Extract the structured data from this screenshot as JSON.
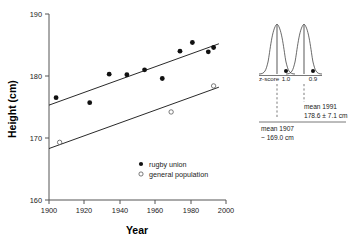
{
  "chart_data": {
    "type": "scatter",
    "title": "",
    "xlabel": "Year",
    "ylabel": "Height (cm)",
    "xlim": [
      1900,
      2000
    ],
    "ylim": [
      160,
      190
    ],
    "xticks": [
      1900,
      1920,
      1940,
      1960,
      1980,
      2000
    ],
    "yticks": [
      160,
      170,
      180,
      190
    ],
    "grid": false,
    "legend_position": "inside-bottom-center",
    "series": [
      {
        "name": "rugby union",
        "marker": "filled-circle",
        "x": [
          1904,
          1923,
          1934,
          1944,
          1954,
          1964,
          1974,
          1981,
          1990,
          1993
        ],
        "y": [
          176.5,
          175.7,
          180.3,
          180.2,
          181.0,
          179.6,
          184.0,
          185.4,
          183.9,
          184.6
        ],
        "trendline": {
          "x": [
            1900,
            1996
          ],
          "y": [
            175.3,
            185.2
          ]
        }
      },
      {
        "name": "general population",
        "marker": "open-circle",
        "x": [
          1906,
          1969,
          1993
        ],
        "y": [
          169.3,
          174.2,
          178.4
        ],
        "trendline": {
          "x": [
            1900,
            1996
          ],
          "y": [
            168.3,
            178.2
          ]
        }
      }
    ]
  },
  "axes": {
    "x_title": "Year",
    "y_title": "Height (cm)",
    "x_tick_labels": [
      "1900",
      "1920",
      "1940",
      "1960",
      "1980",
      "2000"
    ],
    "y_tick_labels": [
      "160",
      "170",
      "180",
      "190"
    ]
  },
  "legend": {
    "entries": [
      {
        "label": "rugby union",
        "marker": "filled-circle"
      },
      {
        "label": "general population",
        "marker": "open-circle"
      }
    ]
  },
  "inset": {
    "zscore_axis_label": "z-score",
    "zscore_left": "1.0",
    "zscore_right": "0.9",
    "annotation_1991_line1": "mean 1991",
    "annotation_1991_line2": "178.6 ± 7.1 cm",
    "annotation_1907_line1": "mean 1907",
    "annotation_1907_line2": "~ 169.0 cm"
  },
  "colors": {
    "ink": "#111111",
    "axis": "#555555",
    "curve": "#444444",
    "vline": "#888888"
  }
}
